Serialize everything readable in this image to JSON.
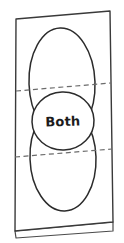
{
  "diagram": {
    "title": "Both",
    "kind": "hand-drawn venn diagram on folded paper",
    "label_both": "Both",
    "colors": {
      "paper_fill": "#ffffff",
      "paper_stroke": "#3a3a3a",
      "ellipse_stroke": "#2b2b2b",
      "fold_line_stroke": "#6b6b6b",
      "label_color": "#1c1c1c",
      "background": "#ffffff"
    },
    "paper": {
      "name": "sheet-of-paper",
      "corners": {
        "top_left": [
          16,
          19
        ],
        "top_right": [
          110,
          11
        ],
        "bottom_right": [
          113,
          222
        ],
        "bottom_left": [
          15,
          231
        ]
      },
      "flap": {
        "name": "bottom-fold-flap",
        "points": [
          [
            15,
            231
          ],
          [
            113,
            222
          ],
          [
            113,
            231
          ],
          [
            16,
            238
          ]
        ]
      }
    },
    "ellipses": [
      {
        "name": "upper-ellipse",
        "cx": 62,
        "cy": 83,
        "rx": 33,
        "ry": 55,
        "rotation": -2
      },
      {
        "name": "lower-ellipse",
        "cx": 63,
        "cy": 158,
        "rx": 33,
        "ry": 53,
        "rotation": -2
      },
      {
        "name": "middle-ellipse",
        "cx": 63,
        "cy": 121,
        "rx": 31,
        "ry": 29,
        "rotation": -2
      }
    ],
    "fold_lines": [
      {
        "name": "upper-fold-line",
        "x1": 16,
        "y1": 91,
        "x2": 111,
        "y2": 83
      },
      {
        "name": "lower-fold-line",
        "x1": 15,
        "y1": 157,
        "x2": 112,
        "y2": 149
      }
    ],
    "label_position": {
      "x": 63,
      "y": 126
    }
  }
}
